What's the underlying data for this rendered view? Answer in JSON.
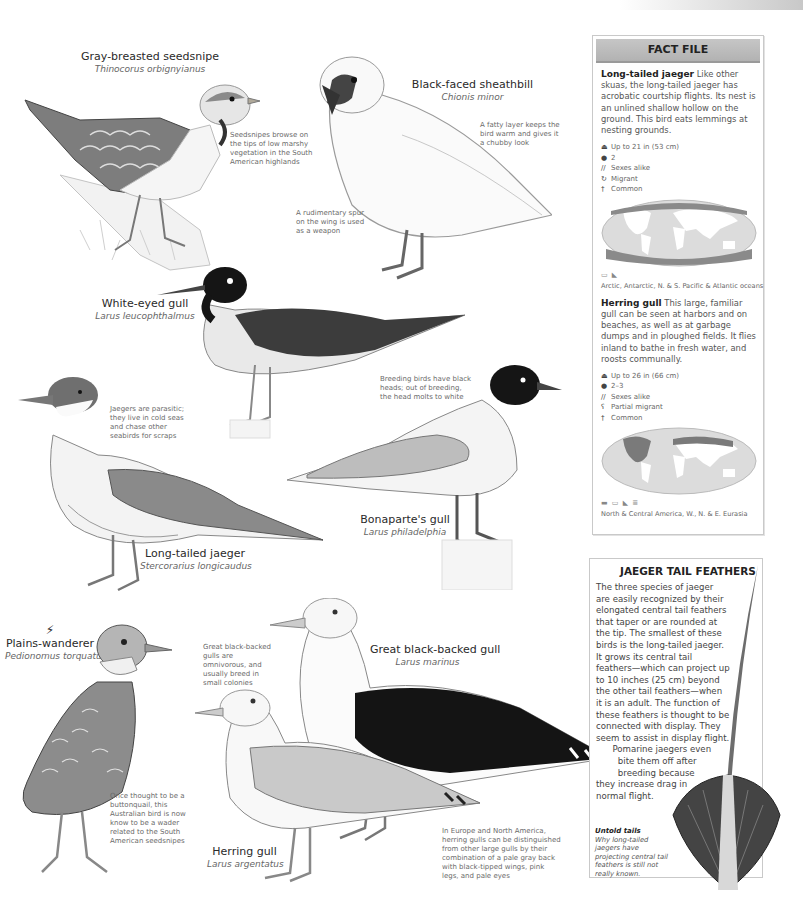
{
  "birds": {
    "seedsnipe": {
      "common": "Gray-breasted seedsnipe",
      "scientific": "Thinocorus orbignyianus",
      "note": "Seedsnipes browse on the tips of low marshy vegetation in the South American highlands"
    },
    "sheathbill": {
      "common": "Black-faced sheathbill",
      "scientific": "Chionis minor",
      "note_fat": "A fatty layer keeps the bird warm and gives it a chubby look",
      "note_spur": "A rudimentary spur on the wing is used as a weapon"
    },
    "white_eyed_gull": {
      "common": "White-eyed gull",
      "scientific": "Larus leucophthalmus"
    },
    "long_tailed_jaeger": {
      "common": "Long-tailed jaeger",
      "scientific": "Stercorarius longicaudus",
      "note": "Jaegers are parasitic; they live in cold seas and chase other seabirds for scraps"
    },
    "bonapartes_gull": {
      "common": "Bonaparte's gull",
      "scientific": "Larus philadelphia",
      "note": "Breeding birds have black heads; out of breeding, the head molts to white"
    },
    "plains_wanderer": {
      "common": "Plains-wanderer",
      "scientific": "Pedionomus torquatus",
      "status_icon": "endangered-icon",
      "note": "Once thought to be a buttonquail, this Australian bird is now know to be a wader related to the South American seedsnipes"
    },
    "great_black_backed_gull": {
      "common": "Great black-backed gull",
      "scientific": "Larus marinus",
      "note": "Great black-backed gulls are omnivorous, and usually breed in small colonies"
    },
    "herring_gull": {
      "common": "Herring gull",
      "scientific": "Larus argentatus",
      "note": "In Europe and North America, herring gulls can be distinguished from other large gulls by their combination of a pale gray back with black-tipped wings, pink legs, and pale eyes"
    }
  },
  "fact_file": {
    "title": "FACT FILE",
    "entries": [
      {
        "name": "Long-tailed jaeger",
        "description": " Like other skuas, the long-tailed jaeger has acrobatic courtship flights. Its nest is an unlined shallow hollow on the ground. This bird eats lemmings at nesting grounds.",
        "facts": [
          {
            "icon": "size-icon",
            "glyph": "⏏",
            "text": "Up to 21 in (53 cm)"
          },
          {
            "icon": "egg-icon",
            "glyph": "●",
            "text": "2"
          },
          {
            "icon": "sexes-icon",
            "glyph": "//",
            "text": "Sexes alike"
          },
          {
            "icon": "migrant-icon",
            "glyph": "↻",
            "text": "Migrant"
          },
          {
            "icon": "status-icon",
            "glyph": "†",
            "text": "Common"
          }
        ],
        "habitat_icons": "▭ ◣",
        "range": "Arctic, Antarctic, N. & S. Pacific & Atlantic oceans"
      },
      {
        "name": "Herring gull",
        "description": " This large, familiar gull can be seen at harbors and on beaches, as well as at garbage dumps and in ploughed fields. It flies inland to bathe in fresh water, and roosts communally.",
        "facts": [
          {
            "icon": "size-icon",
            "glyph": "⏏",
            "text": "Up to 26 in (66 cm)"
          },
          {
            "icon": "egg-icon",
            "glyph": "●",
            "text": "2–3"
          },
          {
            "icon": "sexes-icon",
            "glyph": "//",
            "text": "Sexes alike"
          },
          {
            "icon": "partial-migrant-icon",
            "glyph": "ʕ",
            "text": "Partial migrant"
          },
          {
            "icon": "status-icon",
            "glyph": "†",
            "text": "Common"
          }
        ],
        "habitat_icons": "▬ ▭ ◣ ≣",
        "range": "North & Central America, W., N. & E. Eurasia"
      }
    ]
  },
  "tail_feathers": {
    "title": "JAEGER TAIL FEATHERS",
    "lines": [
      "The three species of jaeger",
      "are easily recognized by their",
      "elongated central tail feathers",
      "that taper or are rounded at",
      "the tip. The smallest of these",
      "birds is the long-tailed jaeger.",
      "It grows its central tail",
      "feathers—which can project up",
      "to 10 inches (25 cm) beyond",
      "the other tail feathers—when",
      "it is an adult. The function of",
      "these feathers is thought to be",
      "connected with display. They",
      "seem to assist in display flight.",
      "      Pomarine jaegers even",
      "        bite them off after",
      "        breeding because",
      "they increase drag in",
      "normal flight."
    ],
    "caption_title": "Untold tails",
    "caption_text": "Why long-tailed jaegers have projecting central tail feathers is still not really known."
  },
  "colors": {
    "header_gray": "#b9b9b9",
    "border": "#c9c9c9",
    "text": "#333333",
    "note_text": "#6a6a6a"
  }
}
